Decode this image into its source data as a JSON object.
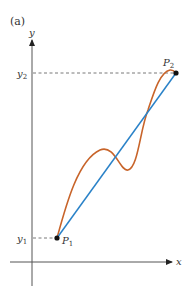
{
  "figure": {
    "panel_label": "(a)",
    "axes": {
      "x_label": "x",
      "y_label": "y"
    },
    "points": {
      "p1": {
        "label": "P",
        "subscript": "1"
      },
      "p2": {
        "label": "P",
        "subscript": "2"
      }
    },
    "y_ticks": {
      "y1": {
        "label": "y",
        "subscript": "1"
      },
      "y2": {
        "label": "y",
        "subscript": "2"
      }
    },
    "colors": {
      "axis": "#555555",
      "curve": "#c8642a",
      "secant": "#2a82c8",
      "dashed": "#555555",
      "point": "#111111"
    }
  }
}
